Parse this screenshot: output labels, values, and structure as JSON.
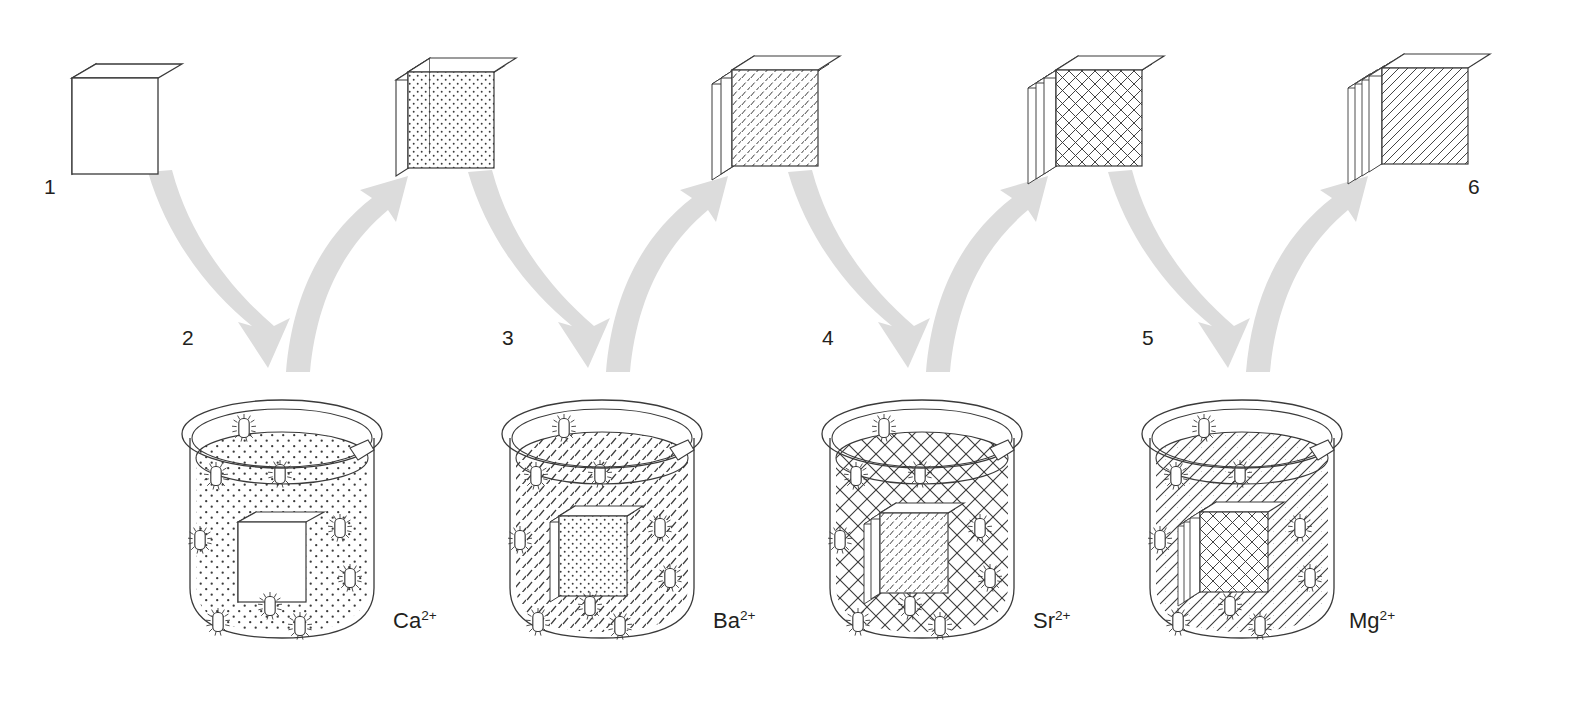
{
  "diagram": {
    "type": "process-flow",
    "background_color": "#ffffff",
    "ink_color": "#3a3a3a",
    "arrow_color": "#dcdcdc",
    "label_color": "#231f20"
  },
  "steps": [
    {
      "id": "1",
      "label": "1",
      "kind": "plate",
      "layers": 1,
      "front_pattern": "plain",
      "x": 48,
      "y": 188
    },
    {
      "id": "2",
      "label": "2",
      "kind": "beaker",
      "ion": "Ca",
      "charge": "2+",
      "solution_pattern": "dots",
      "immersed_front_pattern": "plain",
      "immersed_layers": 1,
      "x": 186,
      "y": 340
    },
    {
      "id": "3",
      "label": "3",
      "kind": "beaker",
      "ion": "Ba",
      "charge": "2+",
      "solution_pattern": "dashes",
      "immersed_front_pattern": "dots",
      "immersed_layers": 2,
      "x": 506,
      "y": 340
    },
    {
      "id": "4",
      "label": "4",
      "kind": "beaker",
      "ion": "Sr",
      "charge": "2+",
      "solution_pattern": "crosshatch",
      "immersed_front_pattern": "dashes",
      "immersed_layers": 3,
      "x": 826,
      "y": 340
    },
    {
      "id": "5",
      "label": "5",
      "kind": "beaker",
      "ion": "Mg",
      "charge": "2+",
      "solution_pattern": "diagonal",
      "immersed_front_pattern": "crosshatch",
      "immersed_layers": 4,
      "x": 1146,
      "y": 340
    },
    {
      "id": "6",
      "label": "6",
      "kind": "plate",
      "layers": 5,
      "front_pattern": "diagonal",
      "x": 1472,
      "y": 188
    }
  ],
  "plates": [
    {
      "index": 0,
      "label": "1",
      "front_pattern": "plain",
      "layers": 1,
      "cx": 140,
      "cy": 110
    },
    {
      "index": 1,
      "label": "",
      "front_pattern": "dots",
      "layers": 2,
      "cx": 452,
      "cy": 110
    },
    {
      "index": 2,
      "label": "",
      "front_pattern": "dashes",
      "layers": 3,
      "cx": 772,
      "cy": 110
    },
    {
      "index": 3,
      "label": "",
      "front_pattern": "crosshatch",
      "layers": 4,
      "cx": 1092,
      "cy": 110
    },
    {
      "index": 4,
      "label": "6",
      "front_pattern": "diagonal",
      "layers": 5,
      "cx": 1412,
      "cy": 110
    }
  ],
  "beakers": [
    {
      "index": 0,
      "ion_symbol": "Ca",
      "ion_charge": "2+",
      "ion_label": "Ca2+",
      "solution_pattern": "dots",
      "cx": 282,
      "cy": 525,
      "label_x": 398,
      "label_y": 613
    },
    {
      "index": 1,
      "ion_symbol": "Ba",
      "ion_charge": "2+",
      "ion_label": "Ba2+",
      "solution_pattern": "dashes",
      "cx": 602,
      "cy": 525,
      "label_x": 718,
      "label_y": 613
    },
    {
      "index": 2,
      "ion_symbol": "Sr",
      "ion_charge": "2+",
      "ion_label": "Sr2+",
      "solution_pattern": "crosshatch",
      "cx": 922,
      "cy": 525,
      "label_x": 1038,
      "label_y": 613
    },
    {
      "index": 3,
      "ion_symbol": "Mg",
      "ion_charge": "2+",
      "ion_label": "Mg2+",
      "solution_pattern": "diagonal",
      "cx": 1242,
      "cy": 525,
      "label_x": 1358,
      "label_y": 613
    }
  ],
  "step_numbers": [
    {
      "text": "1",
      "x": 44,
      "y": 175
    },
    {
      "text": "2",
      "x": 182,
      "y": 326
    },
    {
      "text": "3",
      "x": 502,
      "y": 326
    },
    {
      "text": "4",
      "x": 822,
      "y": 326
    },
    {
      "text": "5",
      "x": 1142,
      "y": 326
    },
    {
      "text": "6",
      "x": 1468,
      "y": 175
    }
  ],
  "ion_labels": [
    {
      "symbol": "Ca",
      "charge": "2+",
      "x": 393,
      "y": 608
    },
    {
      "symbol": "Ba",
      "charge": "2+",
      "x": 713,
      "y": 608
    },
    {
      "symbol": "Sr",
      "charge": "2+",
      "x": 1033,
      "y": 608
    },
    {
      "symbol": "Mg",
      "charge": "2+",
      "x": 1349,
      "y": 608
    }
  ],
  "arrows": [
    {
      "index": 0,
      "direction": "down",
      "from": "plate-1",
      "to": "beaker-Ca"
    },
    {
      "index": 1,
      "direction": "up",
      "from": "beaker-Ca",
      "to": "plate-2"
    },
    {
      "index": 2,
      "direction": "down",
      "from": "plate-2",
      "to": "beaker-Ba"
    },
    {
      "index": 3,
      "direction": "up",
      "from": "beaker-Ba",
      "to": "plate-3"
    },
    {
      "index": 4,
      "direction": "down",
      "from": "plate-3",
      "to": "beaker-Sr"
    },
    {
      "index": 5,
      "direction": "up",
      "from": "beaker-Sr",
      "to": "plate-4"
    },
    {
      "index": 6,
      "direction": "down",
      "from": "plate-4",
      "to": "beaker-Mg"
    },
    {
      "index": 7,
      "direction": "up",
      "from": "beaker-Mg",
      "to": "plate-5"
    }
  ]
}
